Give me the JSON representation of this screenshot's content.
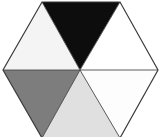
{
  "figure": {
    "name": "hexagon-six-triangle-grayscale-wheel",
    "shape": "hexagon",
    "segment_count": 6,
    "background_color": "#ffffff",
    "outline_color": "#3b3b3b",
    "outline_width_px": 1,
    "width_px": 162,
    "height_px": 137,
    "center": {
      "x": 80,
      "y": 70
    },
    "vertices": [
      {
        "name": "top-left-vertex",
        "x": 42,
        "y": 2
      },
      {
        "name": "top-right-vertex",
        "x": 120,
        "y": 2
      },
      {
        "name": "right-vertex",
        "x": 158,
        "y": 70
      },
      {
        "name": "bottom-right-vertex",
        "x": 120,
        "y": 138
      },
      {
        "name": "bottom-left-vertex",
        "x": 42,
        "y": 138
      },
      {
        "name": "left-vertex",
        "x": 3,
        "y": 70
      }
    ],
    "segments": [
      {
        "id": "top",
        "label": "top triangle",
        "fill": "#0d0d0d",
        "tone": "black",
        "points": "42,2 120,2 80,70"
      },
      {
        "id": "upper-right",
        "label": "upper-right triangle",
        "fill": "#ffffff",
        "tone": "white",
        "points": "120,2 158,70 80,70"
      },
      {
        "id": "lower-right",
        "label": "lower-right triangle",
        "fill": "#fdfdfd",
        "tone": "white",
        "points": "158,70 120,138 80,70"
      },
      {
        "id": "bottom",
        "label": "bottom triangle",
        "fill": "#e0e0e0",
        "tone": "light gray",
        "points": "120,138 42,138 80,70"
      },
      {
        "id": "lower-left",
        "label": "lower-left triangle",
        "fill": "#7d7d7d",
        "tone": "medium gray",
        "points": "42,138 3,70 80,70"
      },
      {
        "id": "upper-left",
        "label": "upper-left triangle",
        "fill": "#f4f4f4",
        "tone": "near white",
        "points": "3,70 42,2 80,70"
      }
    ],
    "divider_color": "#4a4a4a",
    "dividers": [
      {
        "name": "divider-to-top-left",
        "x1": 80,
        "y1": 70,
        "x2": 42,
        "y2": 2
      },
      {
        "name": "divider-to-top-right",
        "x1": 80,
        "y1": 70,
        "x2": 120,
        "y2": 2
      },
      {
        "name": "divider-to-right",
        "x1": 80,
        "y1": 70,
        "x2": 158,
        "y2": 70
      },
      {
        "name": "divider-to-bottom-right",
        "x1": 80,
        "y1": 70,
        "x2": 120,
        "y2": 138
      },
      {
        "name": "divider-to-bottom-left",
        "x1": 80,
        "y1": 70,
        "x2": 42,
        "y2": 138
      },
      {
        "name": "divider-to-left",
        "x1": 80,
        "y1": 70,
        "x2": 3,
        "y2": 70
      }
    ]
  }
}
